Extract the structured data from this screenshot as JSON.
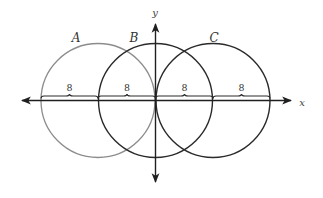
{
  "diagram": {
    "axes": {
      "x_label": "x",
      "y_label": "y",
      "color": "#1f1f1f"
    },
    "circles": [
      {
        "label": "A",
        "cx": 98,
        "cy": 100.5,
        "r": 57,
        "color": "#8c8c8c"
      },
      {
        "label": "B",
        "cx": 155.5,
        "cy": 100.5,
        "r": 57,
        "color": "#2a2a2a"
      },
      {
        "label": "C",
        "cx": 213,
        "cy": 100.5,
        "r": 57,
        "color": "#2a2a2a"
      }
    ],
    "segments": [
      {
        "label": "8",
        "from": 41,
        "to": 98
      },
      {
        "label": "8",
        "from": 98,
        "to": 155.5
      },
      {
        "label": "8",
        "from": 155.5,
        "to": 213
      },
      {
        "label": "8",
        "from": 213,
        "to": 270
      }
    ]
  }
}
